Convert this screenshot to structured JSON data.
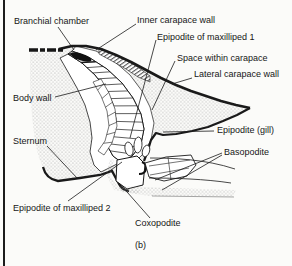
{
  "colors": {
    "ink": "#1a1a1a",
    "paper": "#fbfbf9"
  },
  "caption": {
    "text": "(b)"
  },
  "labels": [
    {
      "id": "branchial-chamber",
      "text": "Branchial chamber",
      "x": 14,
      "y": 16,
      "leaders": [
        [
          58,
          27,
          74,
          50
        ]
      ]
    },
    {
      "id": "inner-carapace-wall",
      "text": "Inner carapace wall",
      "x": 137,
      "y": 15,
      "leaders": [
        [
          136,
          24,
          96,
          50
        ]
      ]
    },
    {
      "id": "epipodite-of-maxilliped-1",
      "text": "Epipodite of maxilliped 1",
      "x": 157,
      "y": 32,
      "leaders": [
        [
          156,
          40,
          130,
          138
        ]
      ]
    },
    {
      "id": "space-within-carapace",
      "text": "Space within carapace",
      "x": 177,
      "y": 53,
      "leaders": [
        [
          175,
          61,
          152,
          110
        ]
      ]
    },
    {
      "id": "lateral-carapace-wall",
      "text": "Lateral carapace wall",
      "x": 194,
      "y": 69,
      "leaders": [
        [
          192,
          78,
          172,
          84
        ]
      ]
    },
    {
      "id": "body-wall",
      "text": "Body wall",
      "x": 13,
      "y": 93,
      "leaders": [
        [
          55,
          97,
          106,
          84
        ]
      ]
    },
    {
      "id": "epipodite-gill",
      "text": "Epipodite (gill)",
      "x": 217,
      "y": 125,
      "leaders": [
        [
          214,
          131,
          163,
          132
        ]
      ]
    },
    {
      "id": "sternum",
      "text": "Sternum",
      "x": 13,
      "y": 136,
      "leaders": [
        [
          47,
          146,
          78,
          179
        ]
      ]
    },
    {
      "id": "basopodite",
      "text": "Basopodite",
      "x": 224,
      "y": 147,
      "leaders": [
        [
          222,
          153,
          155,
          180
        ],
        [
          222,
          155,
          162,
          190
        ]
      ]
    },
    {
      "id": "epipodite-of-maxilliped-2",
      "text": "Epipodite of maxilliped 2",
      "x": 13,
      "y": 203,
      "leaders": [
        [
          68,
          201,
          122,
          162
        ]
      ]
    },
    {
      "id": "coxopodite",
      "text": "Coxopodite",
      "x": 135,
      "y": 218,
      "leaders": [
        [
          150,
          218,
          120,
          184
        ]
      ]
    }
  ]
}
